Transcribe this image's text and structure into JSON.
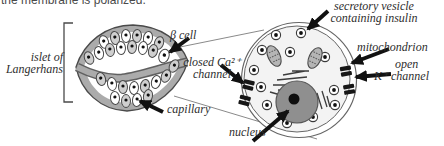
{
  "caption": "the membrane is polarized.",
  "labels": {
    "islet_line1": "islet of",
    "islet_line2": "Langerhans",
    "beta_cell": "β cell",
    "closed_channel_line1": "closed Ca²⁺",
    "closed_channel_line2": "channel",
    "capillary": "capillary",
    "nucleus": "nucleus",
    "vesicle_line1": "secretory vesicle",
    "vesicle_line2": "containing insulin",
    "mitochondrion": "mitochondrion",
    "open_channel_line1": "open",
    "open_channel_line2": "K⁺ channel"
  },
  "colors": {
    "label_text": "#2e2e2e",
    "arrow": "#111111",
    "islet_rim": "#ababab",
    "outline": "#4a4a4a",
    "cell_gray": "#cfcfcf",
    "cytoplasm": "#f3f3f3",
    "nucleus_fill": "#8f8f8f",
    "mitochondrion_fill": "#b5b5b5"
  }
}
